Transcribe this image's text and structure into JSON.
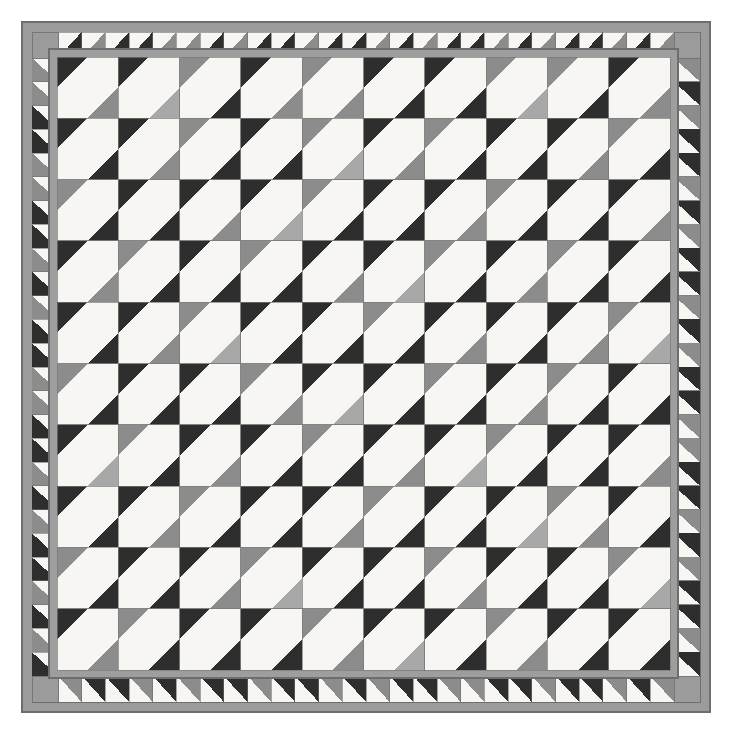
{
  "artwork": {
    "title": "Geometric Quilt — Diagonal Half-Square Triangle Field with Sawtooth Border",
    "medium": "quilt photograph / graphic",
    "canvas": {
      "width": 731,
      "height": 731,
      "background": "#ffffff"
    }
  },
  "palette": {
    "white": "#f7f6f2",
    "off_white": "#efeee9",
    "dark": "#2e2e2e",
    "dark_alt": "#3a3a3a",
    "mid_gray": "#8c8c8c",
    "light_gray": "#a8a8a8",
    "binding_gray": "#9b9b9b",
    "sashing_gray": "#9e9e9e",
    "outline": "#6e6e6e",
    "shadow": "#7a7a7a"
  },
  "layout": {
    "outer_frame": {
      "x": 22,
      "y": 22,
      "width": 688,
      "height": 690
    },
    "binding_width": 10,
    "sawtooth_band_width": 26,
    "sashing_width": 8,
    "field": {
      "x": 57,
      "y": 57,
      "width": 613,
      "height": 613
    },
    "grid": {
      "columns": 10,
      "rows": 10,
      "cell_size": 61.3
    }
  },
  "cell_design": {
    "description": "Square block split by two parallel diagonals running lower-left to upper-right; dark triangle at top-left corner, white diagonal band through center, colored triangle at bottom-right corner.",
    "corner_triangle_fraction": 0.5
  },
  "field_colors": {
    "legend": {
      "D": "#2e2e2e",
      "G": "#8c8c8c",
      "L": "#a8a8a8"
    },
    "top_left_corner_rows": [
      [
        "D",
        "D",
        "G",
        "D",
        "G",
        "D",
        "D",
        "G",
        "G",
        "D"
      ],
      [
        "D",
        "D",
        "G",
        "D",
        "G",
        "D",
        "G",
        "D",
        "D",
        "G"
      ],
      [
        "G",
        "D",
        "D",
        "D",
        "G",
        "D",
        "D",
        "G",
        "D",
        "D"
      ],
      [
        "D",
        "G",
        "D",
        "G",
        "D",
        "D",
        "G",
        "D",
        "G",
        "D"
      ],
      [
        "D",
        "D",
        "G",
        "D",
        "D",
        "G",
        "D",
        "D",
        "D",
        "G"
      ],
      [
        "G",
        "D",
        "D",
        "G",
        "D",
        "D",
        "G",
        "D",
        "G",
        "D"
      ],
      [
        "D",
        "G",
        "D",
        "D",
        "G",
        "D",
        "D",
        "G",
        "D",
        "D"
      ],
      [
        "D",
        "D",
        "G",
        "D",
        "D",
        "G",
        "D",
        "D",
        "G",
        "D"
      ],
      [
        "G",
        "D",
        "D",
        "G",
        "D",
        "D",
        "G",
        "D",
        "D",
        "G"
      ],
      [
        "D",
        "G",
        "D",
        "D",
        "G",
        "D",
        "D",
        "G",
        "D",
        "D"
      ]
    ],
    "bottom_right_corner_rows": [
      [
        "G",
        "L",
        "D",
        "G",
        "G",
        "D",
        "D",
        "L",
        "D",
        "G"
      ],
      [
        "D",
        "G",
        "D",
        "D",
        "L",
        "G",
        "D",
        "D",
        "G",
        "D"
      ],
      [
        "D",
        "D",
        "G",
        "L",
        "D",
        "D",
        "G",
        "D",
        "D",
        "G"
      ],
      [
        "G",
        "D",
        "D",
        "D",
        "G",
        "L",
        "D",
        "G",
        "D",
        "D"
      ],
      [
        "D",
        "G",
        "L",
        "D",
        "D",
        "D",
        "G",
        "D",
        "G",
        "L"
      ],
      [
        "D",
        "D",
        "D",
        "G",
        "L",
        "D",
        "D",
        "G",
        "D",
        "D"
      ],
      [
        "L",
        "D",
        "G",
        "D",
        "D",
        "G",
        "L",
        "D",
        "D",
        "G"
      ],
      [
        "D",
        "G",
        "D",
        "D",
        "G",
        "D",
        "D",
        "L",
        "G",
        "D"
      ],
      [
        "D",
        "D",
        "G",
        "L",
        "D",
        "D",
        "G",
        "D",
        "D",
        "L"
      ],
      [
        "G",
        "D",
        "D",
        "D",
        "G",
        "L",
        "D",
        "G",
        "D",
        "D"
      ]
    ]
  },
  "border": {
    "unit_size": 25.5,
    "top_count": 26,
    "bottom_count": 26,
    "left_count": 26,
    "right_count": 26,
    "top_colors": [
      "D",
      "G",
      "D",
      "D",
      "G",
      "G",
      "D",
      "G",
      "D",
      "D",
      "G",
      "D",
      "D",
      "G",
      "D",
      "G",
      "D",
      "D",
      "G",
      "D",
      "G",
      "D",
      "D",
      "G",
      "D",
      "G"
    ],
    "bottom_colors": [
      "G",
      "D",
      "D",
      "G",
      "D",
      "G",
      "D",
      "D",
      "G",
      "D",
      "D",
      "G",
      "D",
      "G",
      "D",
      "D",
      "G",
      "G",
      "D",
      "D",
      "G",
      "D",
      "D",
      "G",
      "D",
      "G"
    ],
    "left_colors": [
      "G",
      "G",
      "D",
      "D",
      "G",
      "G",
      "D",
      "D",
      "G",
      "D",
      "G",
      "D",
      "D",
      "G",
      "G",
      "D",
      "D",
      "G",
      "D",
      "G",
      "D",
      "D",
      "G",
      "D",
      "G",
      "D"
    ],
    "right_colors": [
      "G",
      "D",
      "G",
      "D",
      "D",
      "G",
      "D",
      "G",
      "D",
      "D",
      "G",
      "D",
      "G",
      "D",
      "D",
      "G",
      "G",
      "D",
      "D",
      "G",
      "D",
      "G",
      "D",
      "D",
      "G",
      "D"
    ]
  },
  "labels": {
    "canvas_name": "quilt-canvas",
    "field_name": "quilt-center-field",
    "border_name": "sawtooth-border"
  }
}
